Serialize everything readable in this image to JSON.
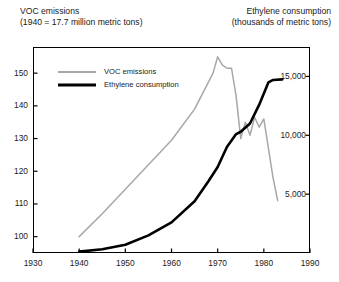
{
  "header": {
    "left_line1": "VOC emissions",
    "left_line2": "(1940 = 17.7 million metric tons)",
    "right_line1": "Ethylene consumption",
    "right_line2": "(thousands of metric tons)"
  },
  "legend": {
    "items": [
      {
        "label": "VOC emissions",
        "color": "#a8a8a8"
      },
      {
        "label": "Ethylene consumption",
        "color": "#000000"
      }
    ]
  },
  "axes": {
    "left_ticks": [
      "100",
      "110",
      "120",
      "130",
      "140",
      "150"
    ],
    "right_ticks": [
      "5,000",
      "10,000",
      "15,000"
    ],
    "x_ticks": [
      "1930",
      "1940",
      "1950",
      "1960",
      "1970",
      "1980",
      "1990"
    ]
  },
  "chart_data": {
    "type": "line",
    "xlabel": "",
    "ylabel": "VOC emissions (1940 = 17.7 million metric tons)",
    "y2label": "Ethylene consumption (thousands of metric tons)",
    "xlim": [
      1930,
      1990
    ],
    "ylim": [
      95,
      158
    ],
    "y2lim": [
      0,
      17500
    ],
    "xticks": [
      1930,
      1940,
      1950,
      1960,
      1970,
      1980,
      1990
    ],
    "yticks": [
      100,
      110,
      120,
      130,
      140,
      150
    ],
    "y2ticks": [
      5000,
      10000,
      15000
    ],
    "grid": false,
    "legend_position": "upper-left",
    "series": [
      {
        "name": "VOC emissions",
        "axis": "left",
        "color": "#a8a8a8",
        "x": [
          1940,
          1945,
          1950,
          1955,
          1960,
          1965,
          1969,
          1970,
          1971,
          1972,
          1973,
          1974,
          1975,
          1976,
          1977,
          1978,
          1979,
          1980,
          1981,
          1982,
          1983
        ],
        "values": [
          100,
          107,
          114.5,
          122,
          129.5,
          139,
          150,
          155,
          152.5,
          151.5,
          151.5,
          143,
          130,
          135,
          131,
          136.5,
          133.5,
          136,
          127,
          118,
          111
        ]
      },
      {
        "name": "Ethylene consumption",
        "axis": "right",
        "color": "#000000",
        "x": [
          1940,
          1945,
          1950,
          1955,
          1960,
          1965,
          1968,
          1970,
          1972,
          1974,
          1975,
          1977,
          1979,
          1981,
          1982,
          1984
        ],
        "values": [
          120,
          320,
          700,
          1500,
          2600,
          4400,
          6100,
          7300,
          9000,
          10100,
          10300,
          11000,
          12600,
          14500,
          14700,
          14750
        ]
      }
    ]
  }
}
